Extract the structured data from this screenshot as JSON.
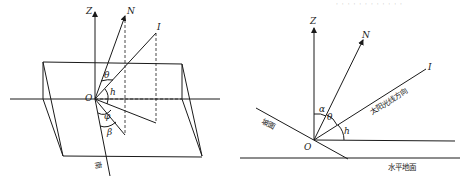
{
  "figure_left": {
    "title": "3D slope geometry",
    "labels": {
      "z_axis": "Z",
      "normal": "N",
      "sun_ray": "I",
      "origin": "O",
      "theta": "θ",
      "h": "h",
      "phi": "φ",
      "beta": "β",
      "south": "南"
    }
  },
  "figure_right": {
    "title": "Cross-section of slope",
    "labels": {
      "z_axis": "Z",
      "normal": "N",
      "sun_ray": "I",
      "origin": "O",
      "alpha": "α",
      "theta": "θ",
      "h": "h",
      "slope": "坡面",
      "sun_direction": "太阳光线方向",
      "horizontal_ground": "水平地面"
    }
  },
  "top_text": "· ·   · ·  · · · · · · · ·"
}
